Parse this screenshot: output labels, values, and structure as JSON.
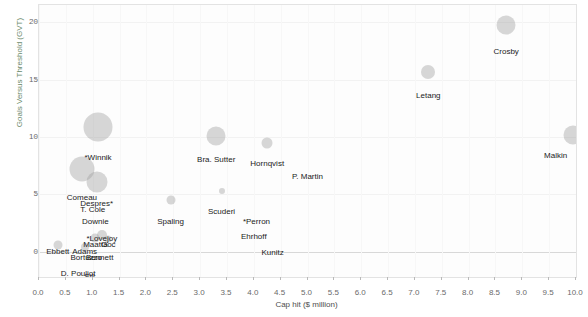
{
  "chart_data": {
    "type": "scatter",
    "title": "",
    "xlabel": "Cap hit ($ million)",
    "ylabel": "Goals Versus Threshold (GVT)",
    "xlim": [
      0.0,
      10.0
    ],
    "ylim": [
      -2.2,
      21.5
    ],
    "xticks": [
      "0.0",
      "0.5",
      "1.0",
      "1.5",
      "2.0",
      "2.5",
      "3.0",
      "3.5",
      "4.0",
      "4.5",
      "5.0",
      "5.5",
      "6.0",
      "6.5",
      "7.0",
      "7.5",
      "8.0",
      "8.5",
      "9.0",
      "9.5",
      "10.0"
    ],
    "xtick_values": [
      0.0,
      0.5,
      1.0,
      1.5,
      2.0,
      2.5,
      3.0,
      3.5,
      4.0,
      4.5,
      5.0,
      5.5,
      6.0,
      6.5,
      7.0,
      7.5,
      8.0,
      8.5,
      9.0,
      9.5,
      10.0
    ],
    "yticks": [
      "0",
      "5",
      "10",
      "15",
      "20"
    ],
    "ytick_values": [
      0,
      5,
      10,
      15,
      20
    ],
    "grid": true,
    "legend": "none",
    "bubble_color": "#a0a0a0",
    "points": [
      {
        "label": "Crosby",
        "x": 8.7,
        "y": 19.8,
        "r": 9.5,
        "lx": 8.7,
        "ly": 17.9
      },
      {
        "label": "Letang",
        "x": 7.25,
        "y": 15.7,
        "r": 7.0,
        "lx": 7.25,
        "ly": 14.1
      },
      {
        "label": "Malkin",
        "x": 9.95,
        "y": 10.2,
        "r": 9.5,
        "lx": 9.62,
        "ly": 8.9
      },
      {
        "label": "*Winnik",
        "x": 1.1,
        "y": 10.9,
        "r": 14.5,
        "lx": 1.1,
        "ly": 8.7
      },
      {
        "label": "Bra. Sutter",
        "x": 3.3,
        "y": 10.1,
        "r": 9.5,
        "lx": 3.3,
        "ly": 8.5
      },
      {
        "label": "Hornqvist",
        "x": 4.25,
        "y": 9.5,
        "r": 5.5,
        "lx": 4.25,
        "ly": 8.2
      },
      {
        "label": "P. Martin",
        "x": 5.0,
        "y": 8.1,
        "r": 0.0,
        "lx": 5.0,
        "ly": 7.0
      },
      {
        "label": "Comeau",
        "x": 0.8,
        "y": 7.2,
        "r": 12.5,
        "lx": 0.8,
        "ly": 5.2
      },
      {
        "label": "Despres*",
        "x": 1.075,
        "y": 6.1,
        "r": 10.5,
        "lx": 1.075,
        "ly": 4.7
      },
      {
        "label": "T. Cole",
        "x": 1.05,
        "y": 5.6,
        "r": 0.0,
        "lx": 1.0,
        "ly": 4.2
      },
      {
        "label": "Scuderi",
        "x": 3.4,
        "y": 5.3,
        "r": 3.0,
        "lx": 3.4,
        "ly": 4.0
      },
      {
        "label": "Downie",
        "x": 1.05,
        "y": 4.4,
        "r": 0.0,
        "lx": 1.05,
        "ly": 3.1
      },
      {
        "label": "Spaling",
        "x": 2.45,
        "y": 4.5,
        "r": 4.5,
        "lx": 2.45,
        "ly": 3.1
      },
      {
        "label": "*Perron",
        "x": 4.05,
        "y": 3.2,
        "r": 0.0,
        "lx": 4.05,
        "ly": 3.1
      },
      {
        "label": "Ehrhoff",
        "x": 4.0,
        "y": 1.9,
        "r": 0.0,
        "lx": 4.0,
        "ly": 1.8
      },
      {
        "label": "*Lovejoy",
        "x": 1.17,
        "y": 1.5,
        "r": 5.0,
        "lx": 1.17,
        "ly": 1.6
      },
      {
        "label": "Maatta",
        "x": 1.05,
        "y": 1.2,
        "r": 4.5,
        "lx": 1.05,
        "ly": 1.1
      },
      {
        "label": "Goc",
        "x": 1.29,
        "y": 1.1,
        "r": 3.5,
        "lx": 1.29,
        "ly": 1.1
      },
      {
        "label": "Adams",
        "x": 0.85,
        "y": 0.45,
        "r": 4.0,
        "lx": 0.85,
        "ly": 0.5
      },
      {
        "label": "Ebbett",
        "x": 0.35,
        "y": 0.55,
        "r": 4.5,
        "lx": 0.35,
        "ly": 0.5
      },
      {
        "label": "Bortuzzo",
        "x": 0.88,
        "y": 0.05,
        "r": 0.0,
        "lx": 0.88,
        "ly": 0.0
      },
      {
        "label": "Bennett",
        "x": 1.13,
        "y": 0.05,
        "r": 0.0,
        "lx": 1.13,
        "ly": 0.0
      },
      {
        "label": "Kunitz",
        "x": 4.35,
        "y": 0.35,
        "r": 0.0,
        "lx": 4.35,
        "ly": 0.4
      },
      {
        "label": "D. Pouliot",
        "x": 0.73,
        "y": -1.5,
        "r": 0.0,
        "lx": 0.73,
        "ly": -1.4
      },
      {
        "label": "Sill",
        "x": 0.94,
        "y": -1.8,
        "r": 0.0,
        "lx": 0.94,
        "ly": -1.7
      },
      {
        "label": "*Lapierre",
        "x": 1.31,
        "y": -1.9,
        "r": 0.0,
        "lx": 1.31,
        "ly": -1.9
      }
    ]
  }
}
